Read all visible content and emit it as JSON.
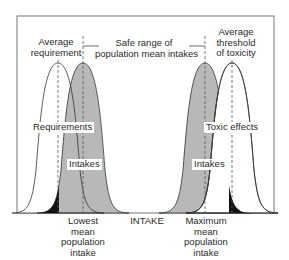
{
  "labels": {
    "average_requirement": [
      "Average",
      "requirement"
    ],
    "safe_range": [
      "Safe range of",
      "population mean intakes"
    ],
    "average_toxicity": [
      "Average",
      "threshold",
      "of toxicity"
    ],
    "requirements": "Requirements",
    "toxic_effects": "Toxic effects",
    "intakes_left": "Intakes",
    "intakes_right": "Intakes",
    "lowest": [
      "Lowest",
      "mean",
      "population",
      "intake"
    ],
    "x_axis": "INTAKE",
    "maximum": [
      "Maximum",
      "mean",
      "population",
      "intake"
    ]
  },
  "colors": {
    "frame": "#555555",
    "curve_stroke": "#333333",
    "intake_fill": "#b8b8b8",
    "requirement_fill": "#ffffff",
    "overlap_fill": "#111111",
    "dashed": "#555555"
  },
  "curves": [
    {
      "name": "requirements-distribution",
      "peak_x": 58,
      "fill": "white"
    },
    {
      "name": "low-intakes-distribution",
      "peak_x": 83,
      "fill": "gray"
    },
    {
      "name": "high-intakes-distribution",
      "peak_x": 205,
      "fill": "gray"
    },
    {
      "name": "toxicity-distribution",
      "peak_x": 232,
      "fill": "white"
    }
  ]
}
